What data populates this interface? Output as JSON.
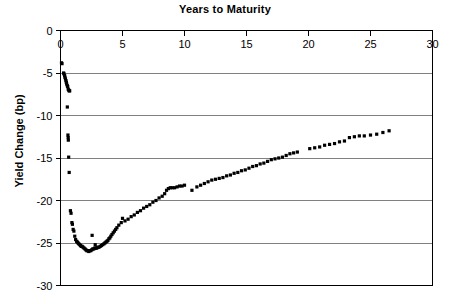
{
  "chart_data": {
    "type": "scatter",
    "title": "Years to Maturity",
    "xlabel": "Years to Maturity",
    "ylabel": "Yield Change (bp)",
    "xlim": [
      0,
      30
    ],
    "ylim": [
      -30,
      0
    ],
    "xticks": [
      0,
      5,
      10,
      15,
      20,
      25,
      30
    ],
    "xtick_labels": [
      "0",
      "5",
      "10",
      "15",
      "20",
      "25",
      "30"
    ],
    "yticks": [
      0,
      -5,
      -10,
      -15,
      -20,
      -25,
      -30
    ],
    "ytick_labels": [
      "0",
      "-5",
      "-10",
      "-15",
      "-20",
      "-25",
      "-30"
    ],
    "grid": "horizontal",
    "x_axis_position": "top",
    "legend": null,
    "marker": "square",
    "marker_color": "#000000",
    "marker_size_px": 3.2,
    "series": [
      {
        "name": "Yield Change",
        "points": [
          [
            0.08,
            -3.8
          ],
          [
            0.12,
            -3.9
          ],
          [
            0.25,
            -5.0
          ],
          [
            0.28,
            -5.1
          ],
          [
            0.33,
            -5.3
          ],
          [
            0.36,
            -5.5
          ],
          [
            0.4,
            -5.7
          ],
          [
            0.44,
            -5.9
          ],
          [
            0.47,
            -6.1
          ],
          [
            0.5,
            -6.3
          ],
          [
            0.55,
            -6.5
          ],
          [
            0.58,
            -6.6
          ],
          [
            0.62,
            -6.9
          ],
          [
            0.66,
            -7.0
          ],
          [
            0.7,
            -7.1
          ],
          [
            0.74,
            -7.1
          ],
          [
            0.55,
            -9.0
          ],
          [
            0.6,
            -12.3
          ],
          [
            0.62,
            -12.6
          ],
          [
            0.63,
            -12.9
          ],
          [
            0.66,
            -14.9
          ],
          [
            0.7,
            -16.7
          ],
          [
            0.8,
            -21.2
          ],
          [
            0.85,
            -21.5
          ],
          [
            0.92,
            -22.6
          ],
          [
            0.96,
            -22.8
          ],
          [
            1.02,
            -23.4
          ],
          [
            1.08,
            -23.6
          ],
          [
            1.15,
            -24.2
          ],
          [
            1.22,
            -24.6
          ],
          [
            1.3,
            -24.8
          ],
          [
            1.36,
            -24.9
          ],
          [
            1.42,
            -25.0
          ],
          [
            1.48,
            -25.1
          ],
          [
            1.55,
            -25.2
          ],
          [
            1.62,
            -25.3
          ],
          [
            1.68,
            -25.4
          ],
          [
            1.75,
            -25.4
          ],
          [
            1.82,
            -25.5
          ],
          [
            1.9,
            -25.6
          ],
          [
            1.98,
            -25.7
          ],
          [
            2.05,
            -25.8
          ],
          [
            2.12,
            -25.9
          ],
          [
            2.2,
            -25.9
          ],
          [
            2.28,
            -26.0
          ],
          [
            2.36,
            -25.9
          ],
          [
            2.44,
            -25.9
          ],
          [
            2.52,
            -25.8
          ],
          [
            2.6,
            -25.7
          ],
          [
            2.68,
            -25.7
          ],
          [
            2.76,
            -25.6
          ],
          [
            2.84,
            -25.6
          ],
          [
            2.92,
            -25.6
          ],
          [
            3.0,
            -25.5
          ],
          [
            2.55,
            -24.1
          ],
          [
            2.8,
            -25.2
          ],
          [
            3.1,
            -25.5
          ],
          [
            3.2,
            -25.4
          ],
          [
            3.3,
            -25.3
          ],
          [
            3.4,
            -25.2
          ],
          [
            3.5,
            -25.1
          ],
          [
            3.58,
            -25.0
          ],
          [
            3.66,
            -24.9
          ],
          [
            3.74,
            -24.8
          ],
          [
            3.82,
            -24.7
          ],
          [
            3.9,
            -24.5
          ],
          [
            3.98,
            -24.4
          ],
          [
            4.06,
            -24.2
          ],
          [
            4.15,
            -24.0
          ],
          [
            4.25,
            -23.8
          ],
          [
            4.35,
            -23.6
          ],
          [
            4.45,
            -23.4
          ],
          [
            4.55,
            -23.2
          ],
          [
            4.7,
            -22.9
          ],
          [
            4.9,
            -22.6
          ],
          [
            5.0,
            -22.1
          ],
          [
            5.2,
            -22.4
          ],
          [
            5.45,
            -22.2
          ],
          [
            5.7,
            -21.9
          ],
          [
            5.95,
            -21.7
          ],
          [
            6.2,
            -21.4
          ],
          [
            6.45,
            -21.2
          ],
          [
            6.7,
            -20.9
          ],
          [
            6.95,
            -20.7
          ],
          [
            7.2,
            -20.5
          ],
          [
            7.45,
            -20.2
          ],
          [
            7.7,
            -20.0
          ],
          [
            7.95,
            -19.7
          ],
          [
            8.2,
            -19.5
          ],
          [
            8.4,
            -19.2
          ],
          [
            8.55,
            -18.8
          ],
          [
            8.7,
            -18.6
          ],
          [
            8.85,
            -18.5
          ],
          [
            9.0,
            -18.5
          ],
          [
            9.2,
            -18.5
          ],
          [
            9.4,
            -18.4
          ],
          [
            9.6,
            -18.3
          ],
          [
            9.8,
            -18.3
          ],
          [
            10.0,
            -18.2
          ],
          [
            10.6,
            -18.8
          ],
          [
            11.0,
            -18.4
          ],
          [
            11.3,
            -18.2
          ],
          [
            11.6,
            -18.0
          ],
          [
            11.9,
            -17.8
          ],
          [
            12.2,
            -17.6
          ],
          [
            12.5,
            -17.5
          ],
          [
            12.8,
            -17.4
          ],
          [
            13.1,
            -17.3
          ],
          [
            13.4,
            -17.1
          ],
          [
            13.7,
            -17.0
          ],
          [
            14.0,
            -16.8
          ],
          [
            14.3,
            -16.7
          ],
          [
            14.6,
            -16.5
          ],
          [
            14.9,
            -16.4
          ],
          [
            15.2,
            -16.2
          ],
          [
            15.5,
            -16.0
          ],
          [
            15.8,
            -15.9
          ],
          [
            16.1,
            -15.7
          ],
          [
            16.4,
            -15.6
          ],
          [
            16.7,
            -15.4
          ],
          [
            17.0,
            -15.2
          ],
          [
            17.3,
            -15.1
          ],
          [
            17.6,
            -15.0
          ],
          [
            17.9,
            -14.9
          ],
          [
            18.2,
            -14.7
          ],
          [
            18.5,
            -14.5
          ],
          [
            18.8,
            -14.4
          ],
          [
            19.1,
            -14.3
          ],
          [
            20.1,
            -13.9
          ],
          [
            20.5,
            -13.8
          ],
          [
            20.9,
            -13.7
          ],
          [
            21.3,
            -13.5
          ],
          [
            21.7,
            -13.4
          ],
          [
            22.1,
            -13.3
          ],
          [
            22.5,
            -13.1
          ],
          [
            22.9,
            -13.0
          ],
          [
            23.3,
            -12.6
          ],
          [
            23.7,
            -12.5
          ],
          [
            24.1,
            -12.4
          ],
          [
            24.5,
            -12.4
          ],
          [
            25.0,
            -12.3
          ],
          [
            25.5,
            -12.2
          ],
          [
            26.0,
            -12.0
          ],
          [
            26.5,
            -11.8
          ]
        ]
      }
    ]
  }
}
